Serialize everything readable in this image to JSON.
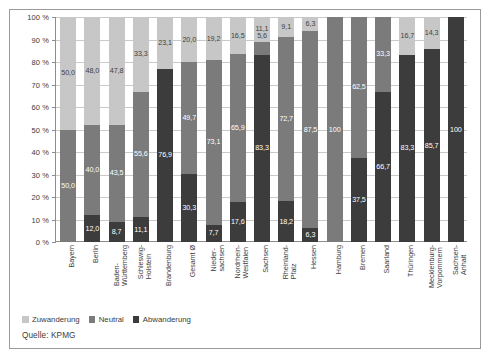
{
  "chart_data": {
    "type": "bar",
    "subtype": "stacked-100-percent",
    "title": "",
    "xlabel": "",
    "ylabel": "",
    "ylim": [
      0,
      100
    ],
    "yticks": [
      "0 %",
      "10 %",
      "20 %",
      "30 %",
      "40 %",
      "50 %",
      "60 %",
      "70 %",
      "80 %",
      "90 %",
      "100 %"
    ],
    "ytick_values": [
      0,
      10,
      20,
      30,
      40,
      50,
      60,
      70,
      80,
      90,
      100
    ],
    "grid": true,
    "legend_position": "bottom-left",
    "source": "Quelle: KPMG",
    "categories": [
      "Bayern",
      "Berlin",
      "Baden-Württemberg",
      "Schleswig-Holstein",
      "Brandenburg",
      "Gesamt Ø",
      "Niedersachsen",
      "Nordrhein-Westfalen",
      "Sachsen",
      "Rheinland-Pfalz",
      "Hessen",
      "Hamburg",
      "Bremen",
      "Saarland",
      "Thüringen",
      "Mecklenburg-Vorpommern",
      "Sachsen-Anhalt"
    ],
    "category_lines": [
      [
        "Bayern"
      ],
      [
        "Berlin"
      ],
      [
        "Baden-",
        "Württemberg"
      ],
      [
        "Schleswig-",
        "Holstein"
      ],
      [
        "Brandenburg"
      ],
      [
        "Gesamt Ø"
      ],
      [
        "Nieder-",
        "sachsen"
      ],
      [
        "Nordrhein-",
        "Westfalen"
      ],
      [
        "Sachsen"
      ],
      [
        "Rheinland-",
        "Pfalz"
      ],
      [
        "Hessen"
      ],
      [
        "Hamburg"
      ],
      [
        "Bremen"
      ],
      [
        "Saarland"
      ],
      [
        "Thüringen"
      ],
      [
        "Mecklenburg-",
        "Vorpommern"
      ],
      [
        "Sachsen-",
        "Anhalt"
      ]
    ],
    "series": [
      {
        "name": "Zuwanderung",
        "color": "#c7c7c7",
        "values": [
          50.0,
          48.0,
          47.8,
          33.3,
          23.1,
          20.0,
          19.2,
          16.5,
          11.1,
          9.1,
          6.3,
          0,
          0,
          0,
          16.7,
          14.3,
          0
        ],
        "labels": [
          "50,0",
          "48,0",
          "47,8",
          "33,3",
          "23,1",
          "20,0",
          "19,2",
          "16,5",
          "11,1",
          "9,1",
          "6,3",
          "",
          "",
          "",
          "16,7",
          "14,3",
          ""
        ]
      },
      {
        "name": "Neutral",
        "color": "#7b7b7b",
        "values": [
          50.0,
          40.0,
          43.5,
          55.6,
          0,
          49.7,
          73.1,
          65.9,
          5.6,
          72.7,
          87.5,
          100,
          62.5,
          33.3,
          0,
          0,
          0
        ],
        "labels": [
          "50,0",
          "40,0",
          "43,5",
          "55,6",
          "",
          "49,7",
          "73,1",
          "65,9",
          "5,6",
          "72,7",
          "87,5",
          "100",
          "62,5",
          "33,3",
          "",
          "",
          ""
        ]
      },
      {
        "name": "Abwanderung",
        "color": "#3c3c3c",
        "values": [
          0,
          12.0,
          8.7,
          11.1,
          76.9,
          30.3,
          7.7,
          17.6,
          83.3,
          18.2,
          6.3,
          0,
          37.5,
          66.7,
          83.3,
          85.7,
          100
        ],
        "labels": [
          "",
          "12,0",
          "8,7",
          "11,1",
          "76,9",
          "30,3",
          "7,7",
          "17,6",
          "83,3",
          "18,2",
          "6,3",
          "",
          "37,5",
          "66,7",
          "83,3",
          "85,7",
          "100"
        ]
      }
    ]
  },
  "legend": {
    "items": [
      {
        "label": "Zuwanderung",
        "color": "#c7c7c7"
      },
      {
        "label": "Neutral",
        "color": "#7b7b7b"
      },
      {
        "label": "Abwanderung",
        "color": "#3c3c3c"
      }
    ]
  },
  "footer": {
    "source": "Quelle: KPMG"
  },
  "colors": {
    "zuwanderung": "#c7c7c7",
    "neutral": "#7b7b7b",
    "abwanderung": "#3c3c3c",
    "grid": "#c9c9c9",
    "axis": "#8d8d8d",
    "text": "#3b3b3b",
    "frame": "#9a9a9a"
  }
}
